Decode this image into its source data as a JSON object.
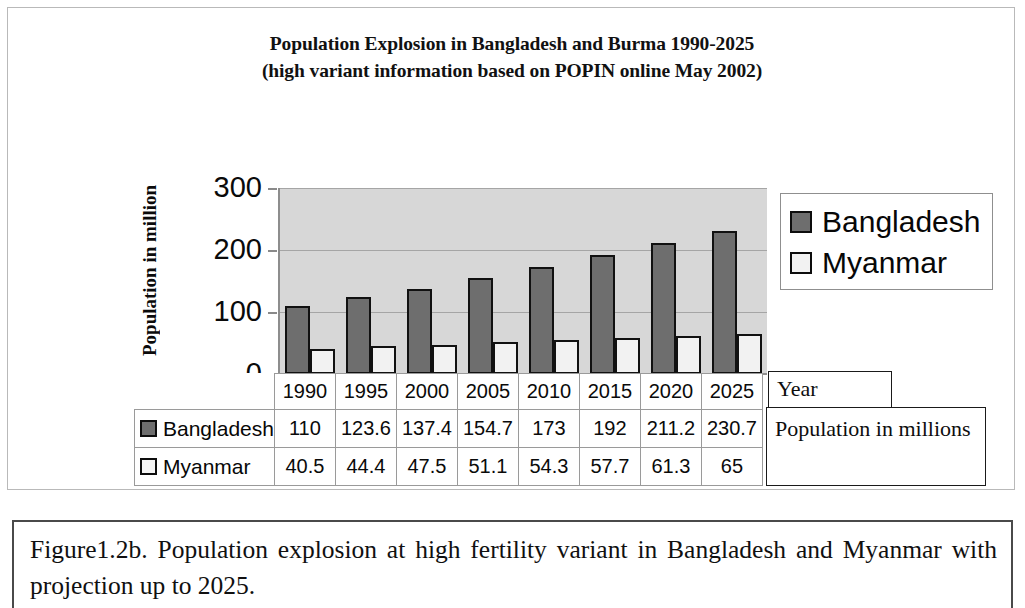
{
  "chart_data": {
    "type": "bar",
    "title": "Population Explosion in Bangladesh and Burma 1990-2025",
    "subtitle": "(high variant information based on POPIN online May 2002)",
    "xlabel": "Year",
    "ylabel": "Population in million",
    "categories": [
      "1990",
      "1995",
      "2000",
      "2005",
      "2010",
      "2015",
      "2020",
      "2025"
    ],
    "series": [
      {
        "name": "Bangladesh",
        "color": "#6e6e6e",
        "values": [
          110,
          123.6,
          137.4,
          154.7,
          173,
          192,
          211.2,
          230.7
        ],
        "labels": [
          "110",
          "123.6",
          "137.4",
          "154.7",
          "173",
          "192",
          "211.2",
          "230.7"
        ]
      },
      {
        "name": "Myanmar",
        "color": "#f2f2f2",
        "values": [
          40.5,
          44.4,
          47.5,
          51.1,
          54.3,
          57.7,
          61.3,
          65
        ],
        "labels": [
          "40.5",
          "44.4",
          "47.5",
          "51.1",
          "54.3",
          "57.7",
          "61.3",
          "65"
        ]
      }
    ],
    "ylim": [
      0,
      300
    ],
    "yticks": [
      0,
      100,
      200,
      300
    ],
    "ytick_labels": [
      "0",
      "100",
      "200",
      "300"
    ],
    "grid": true,
    "legend_position": "right",
    "plot_background": "#d7d7d7"
  },
  "title": {
    "line1": "Population Explosion in Bangladesh and Burma 1990-2025",
    "line2": "(high variant information based on POPIN online May 2002)"
  },
  "axes": {
    "y_title": "Population in million",
    "y_ticks": [
      "300",
      "200",
      "100",
      "0"
    ]
  },
  "legend": {
    "items": [
      {
        "label": "Bangladesh"
      },
      {
        "label": "Myanmar"
      }
    ]
  },
  "table": {
    "years": [
      "1990",
      "1995",
      "2000",
      "2005",
      "2010",
      "2015",
      "2020",
      "2025"
    ],
    "rows": [
      {
        "label": "Bangladesh",
        "values": [
          "110",
          "123.6",
          "137.4",
          "154.7",
          "173",
          "192",
          "211.2",
          "230.7"
        ]
      },
      {
        "label": "Myanmar",
        "values": [
          "40.5",
          "44.4",
          "47.5",
          "51.1",
          "54.3",
          "57.7",
          "61.3",
          "65"
        ]
      }
    ]
  },
  "callouts": {
    "year": "Year",
    "population": "Population in millions"
  },
  "caption": {
    "text": "Figure1.2b. Population explosion at high fertility variant in Bangladesh and Myanmar with projection up to 2025."
  }
}
